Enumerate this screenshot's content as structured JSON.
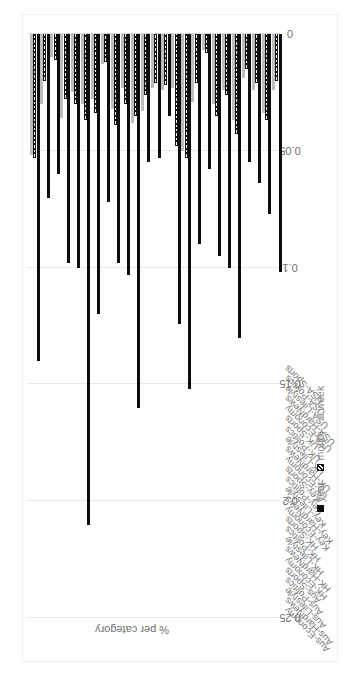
{
  "chart_data": {
    "type": "bar",
    "orientation": "horizontal-rotated",
    "title": "",
    "xlabel": "",
    "ylabel": "% per category",
    "ylim": [
      0,
      0.25
    ],
    "grid": true,
    "legend_position": "bottom",
    "tick_labels": [
      "0.25",
      "0.2",
      "0.15",
      "0.1",
      "0.05",
      "0"
    ],
    "tick_values": [
      0.25,
      0.2,
      0.15,
      0.1,
      0.05,
      0
    ],
    "categories": [
      "Aus-Economy",
      "Aus-HardNews",
      "Aus-Lifestyle",
      "Aus-Politics",
      "Aus-Sports",
      "HK-Economy",
      "HK-HardNews",
      "HK-Lifestyle",
      "HK-Politics",
      "HK-Sports",
      "Key-Economy",
      "Key-HardNews",
      "Key-Lifestyle",
      "Key-Politics",
      "Key-Sports",
      "UK-Economy",
      "UK-HardNews",
      "UK-Lifestyle",
      "UK-Politics",
      "UK-Sports",
      "USA-Economy",
      "USA-HardNews",
      "USA-Lifestyle",
      "USA-Politics",
      "USA-Sports"
    ],
    "series": [
      {
        "name": "year",
        "color": "#0d0d0d",
        "values": [
          0.14,
          0.07,
          0.06,
          0.098,
          0.1,
          0.21,
          0.12,
          0.072,
          0.098,
          0.103,
          0.16,
          0.055,
          0.053,
          0.035,
          0.124,
          0.152,
          0.09,
          0.058,
          0.095,
          0.1,
          0.13,
          0.055,
          0.064,
          0.077,
          0.102
        ]
      },
      {
        "name": "month",
        "color": "#111111",
        "pattern": "diagonal-hatch",
        "values": [
          0.053,
          0.02,
          0.011,
          0.028,
          0.03,
          0.037,
          0.034,
          0.012,
          0.039,
          0.03,
          0.035,
          0.026,
          0.021,
          0.022,
          0.048,
          0.053,
          0.021,
          0.008,
          0.035,
          0.026,
          0.043,
          0.015,
          0.021,
          0.037,
          0.02
        ]
      },
      {
        "name": "week",
        "color": "#bdbdbd",
        "values": [
          0.052,
          0.03,
          0.01,
          0.036,
          0.025,
          0.03,
          0.028,
          0.013,
          0.032,
          0.023,
          0.038,
          0.033,
          0.023,
          0.024,
          0.023,
          0.05,
          0.029,
          0.007,
          0.03,
          0.024,
          0.037,
          0.019,
          0.024,
          0.034,
          0.024
        ]
      }
    ],
    "legend_entries": [
      "year",
      "month",
      "week"
    ]
  }
}
